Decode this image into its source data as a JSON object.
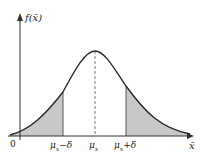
{
  "diagram": {
    "type": "normal-distribution-tails",
    "y_axis_label": "f(x̄)",
    "x_axis_label": "x̄",
    "origin_label": "0",
    "ticks": [
      {
        "label": "μx−δ",
        "base": "μ",
        "sub": "x",
        "suffix": "−δ"
      },
      {
        "label": "μx",
        "base": "μ",
        "sub": "x",
        "suffix": ""
      },
      {
        "label": "μx+δ",
        "base": "μ",
        "sub": "x",
        "suffix": "+δ"
      }
    ],
    "colors": {
      "curve": "#222222",
      "shade": "#c8c8c8",
      "axis": "#333333"
    }
  }
}
